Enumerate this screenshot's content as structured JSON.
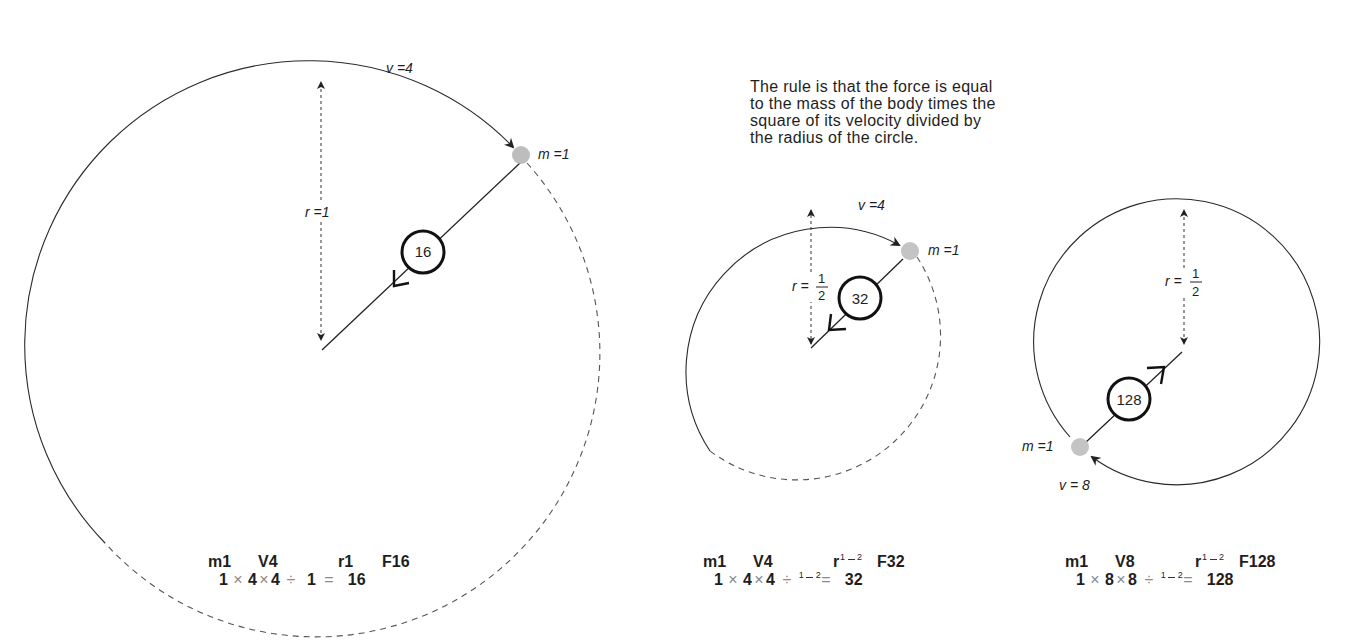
{
  "caption": {
    "lines": [
      "The rule is that the force is equal",
      "to the mass of the body times the",
      "square of its velocity divided by",
      "the radius  of the circle."
    ]
  },
  "diagrams": [
    {
      "id": "large",
      "velocity_label": "v =4",
      "mass_label": "m =1",
      "radius_label": "r =1",
      "force_value": "16",
      "formula": {
        "header": [
          "m1",
          "V4",
          "r1",
          "F16"
        ],
        "calc": {
          "m": "1",
          "times1": "×",
          "v1": "4",
          "times2": "×",
          "v2": "4",
          "div": "÷",
          "r": "1",
          "eq": "=",
          "f": "16"
        }
      }
    },
    {
      "id": "medium-v4",
      "velocity_label": "v =4",
      "mass_label": "m =1",
      "radius_label_prefix": "r =",
      "radius_num": "1",
      "radius_den": "2",
      "force_value": "32",
      "formula": {
        "header": [
          "m1",
          "V4",
          "r",
          "F32"
        ],
        "calc": {
          "m": "1",
          "times1": "×",
          "v1": "4",
          "times2": "×",
          "v2": "4",
          "div": "÷",
          "r_num": "1",
          "r_den": "2",
          "eq": "=",
          "f": "32"
        }
      }
    },
    {
      "id": "medium-v8",
      "velocity_label": "v = 8",
      "mass_label": "m =1",
      "radius_label_prefix": "r =",
      "radius_num": "1",
      "radius_den": "2",
      "force_value": "128",
      "formula": {
        "header": [
          "m1",
          "V8",
          "r",
          "F128"
        ],
        "calc": {
          "m": "1",
          "times1": "×",
          "v1": "8",
          "times2": "×",
          "v2": "8",
          "div": "÷",
          "r_num": "1",
          "r_den": "2",
          "eq": "=",
          "f": "128"
        }
      }
    }
  ],
  "colors": {
    "line": "#2a2a2a",
    "dashed": "#555555",
    "mass_ball": "#bdbdbd",
    "operator": "#8a8a8a"
  }
}
